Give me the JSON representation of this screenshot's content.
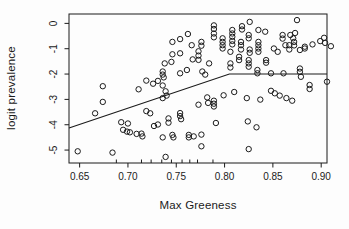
{
  "chart_data": {
    "type": "scatter",
    "title": "",
    "xlabel": "Max Greeness",
    "ylabel": "logit prevalence",
    "xlim": [
      0.639,
      0.906
    ],
    "ylim": [
      -5.51,
      0.37
    ],
    "x_ticks": [
      0.65,
      0.7,
      0.75,
      0.8,
      0.85,
      0.9
    ],
    "x_tick_labels": [
      "0.65",
      "0.70",
      "0.75",
      "0.80",
      "0.85",
      "0.90"
    ],
    "y_ticks": [
      0,
      -1,
      -2,
      -3,
      -4,
      -5
    ],
    "y_tick_labels": [
      "0",
      "-1",
      "-2",
      "-3",
      "-4",
      "-5"
    ],
    "grid": false,
    "legend": "none",
    "marker": "open-circle",
    "point_color": "#1b1b1b",
    "line_color": "#1b1b1b",
    "frame_color": "#1b1b1b",
    "rug_x": [
      0.688,
      0.714,
      0.724,
      0.735,
      0.745,
      0.756,
      0.764,
      0.772,
      0.788
    ],
    "fit_line": [
      [
        0.639,
        -4.13
      ],
      [
        0.805,
        -2.0
      ],
      [
        0.906,
        -2.0
      ]
    ],
    "points": [
      [
        0.648,
        -5.05
      ],
      [
        0.684,
        -5.1
      ],
      [
        0.666,
        -3.55
      ],
      [
        0.674,
        -2.48
      ],
      [
        0.674,
        -3.1
      ],
      [
        0.693,
        -3.9
      ],
      [
        0.7,
        -3.95
      ],
      [
        0.695,
        -4.2
      ],
      [
        0.699,
        -4.27
      ],
      [
        0.702,
        -4.3
      ],
      [
        0.709,
        -4.36
      ],
      [
        0.714,
        -4.35
      ],
      [
        0.715,
        -4.46
      ],
      [
        0.711,
        -2.6
      ],
      [
        0.719,
        -2.26
      ],
      [
        0.719,
        -3.46
      ],
      [
        0.723,
        -3.55
      ],
      [
        0.726,
        -2.38
      ],
      [
        0.731,
        -2.27
      ],
      [
        0.736,
        -2.45
      ],
      [
        0.727,
        -4.05
      ],
      [
        0.731,
        -3.99
      ],
      [
        0.736,
        -4.5
      ],
      [
        0.736,
        -2.95
      ],
      [
        0.74,
        -2.85
      ],
      [
        0.739,
        -2.68
      ],
      [
        0.742,
        -3.75
      ],
      [
        0.742,
        -3.92
      ],
      [
        0.746,
        -4.4
      ],
      [
        0.747,
        -4.5
      ],
      [
        0.763,
        -4.4
      ],
      [
        0.763,
        -4.5
      ],
      [
        0.768,
        -4.46
      ],
      [
        0.739,
        -5.27
      ],
      [
        0.736,
        -1.9
      ],
      [
        0.736,
        -2.02
      ],
      [
        0.737,
        -2.13
      ],
      [
        0.738,
        -1.58
      ],
      [
        0.745,
        -1.52
      ],
      [
        0.746,
        -0.73
      ],
      [
        0.746,
        -1.22
      ],
      [
        0.754,
        -0.62
      ],
      [
        0.754,
        -1.18
      ],
      [
        0.762,
        -0.42
      ],
      [
        0.766,
        -0.86
      ],
      [
        0.767,
        -1.42
      ],
      [
        0.754,
        -1.97
      ],
      [
        0.761,
        -1.84
      ],
      [
        0.754,
        -3.54
      ],
      [
        0.754,
        -3.66
      ],
      [
        0.755,
        -3.78
      ],
      [
        0.773,
        -3.21
      ],
      [
        0.782,
        -2.92
      ],
      [
        0.783,
        -3.14
      ],
      [
        0.789,
        -3.05
      ],
      [
        0.789,
        -3.17
      ],
      [
        0.789,
        -3.28
      ],
      [
        0.791,
        -3.93
      ],
      [
        0.773,
        -1.1
      ],
      [
        0.773,
        -1.27
      ],
      [
        0.773,
        -1.44
      ],
      [
        0.776,
        -0.73
      ],
      [
        0.776,
        -0.88
      ],
      [
        0.777,
        -1.9
      ],
      [
        0.78,
        -2.02
      ],
      [
        0.784,
        -1.58
      ],
      [
        0.789,
        -0.08
      ],
      [
        0.789,
        -0.22
      ],
      [
        0.789,
        -0.4
      ],
      [
        0.789,
        -0.55
      ],
      [
        0.798,
        -0.59
      ],
      [
        0.798,
        -0.73
      ],
      [
        0.798,
        -0.86
      ],
      [
        0.798,
        -0.99
      ],
      [
        0.808,
        -0.26
      ],
      [
        0.808,
        -0.4
      ],
      [
        0.808,
        -0.53
      ],
      [
        0.808,
        -0.69
      ],
      [
        0.808,
        -0.83
      ],
      [
        0.806,
        -1.12
      ],
      [
        0.806,
        -1.58
      ],
      [
        0.806,
        -1.74
      ],
      [
        0.818,
        -0.11
      ],
      [
        0.818,
        -0.24
      ],
      [
        0.826,
        0.06
      ],
      [
        0.825,
        -0.46
      ],
      [
        0.825,
        -0.59
      ],
      [
        0.817,
        -0.73
      ],
      [
        0.817,
        -0.86
      ],
      [
        0.817,
        -1.03
      ],
      [
        0.826,
        -1.03
      ],
      [
        0.826,
        -1.16
      ],
      [
        0.815,
        -1.32
      ],
      [
        0.815,
        -1.45
      ],
      [
        0.825,
        -1.45
      ],
      [
        0.825,
        -1.58
      ],
      [
        0.825,
        -1.71
      ],
      [
        0.834,
        -1.84
      ],
      [
        0.834,
        -1.97
      ],
      [
        0.835,
        -0.26
      ],
      [
        0.835,
        -0.73
      ],
      [
        0.835,
        -0.86
      ],
      [
        0.835,
        -0.99
      ],
      [
        0.835,
        -1.12
      ],
      [
        0.842,
        -0.33
      ],
      [
        0.843,
        -1.45
      ],
      [
        0.843,
        -1.55
      ],
      [
        0.851,
        -0.99
      ],
      [
        0.855,
        -1.12
      ],
      [
        0.848,
        -1.97
      ],
      [
        0.861,
        -1.97
      ],
      [
        0.86,
        -0.46
      ],
      [
        0.86,
        -0.6
      ],
      [
        0.871,
        -0.59
      ],
      [
        0.863,
        -0.86
      ],
      [
        0.872,
        -0.73
      ],
      [
        0.872,
        -0.87
      ],
      [
        0.868,
        -0.46
      ],
      [
        0.873,
        -0.38
      ],
      [
        0.867,
        -0.86
      ],
      [
        0.867,
        -1.03
      ],
      [
        0.875,
        0.13
      ],
      [
        0.878,
        -1.05
      ],
      [
        0.883,
        -0.99
      ],
      [
        0.878,
        -1.78
      ],
      [
        0.878,
        -1.91
      ],
      [
        0.879,
        -2.11
      ],
      [
        0.883,
        -0.92
      ],
      [
        0.891,
        -0.83
      ],
      [
        0.899,
        -0.7
      ],
      [
        0.903,
        -0.57
      ],
      [
        0.904,
        -0.77
      ],
      [
        0.91,
        -0.9
      ],
      [
        0.888,
        -2.43
      ],
      [
        0.906,
        -2.3
      ],
      [
        0.799,
        -2.84
      ],
      [
        0.81,
        -2.71
      ],
      [
        0.823,
        -2.95
      ],
      [
        0.837,
        -3.01
      ],
      [
        0.848,
        -2.66
      ],
      [
        0.852,
        -2.76
      ],
      [
        0.857,
        -2.85
      ],
      [
        0.864,
        -2.95
      ],
      [
        0.87,
        -3.05
      ],
      [
        0.888,
        -2.59
      ],
      [
        0.824,
        -3.87
      ],
      [
        0.833,
        -4.1
      ],
      [
        0.776,
        -4.39
      ],
      [
        0.776,
        -4.85
      ],
      [
        0.825,
        -4.96
      ]
    ]
  }
}
